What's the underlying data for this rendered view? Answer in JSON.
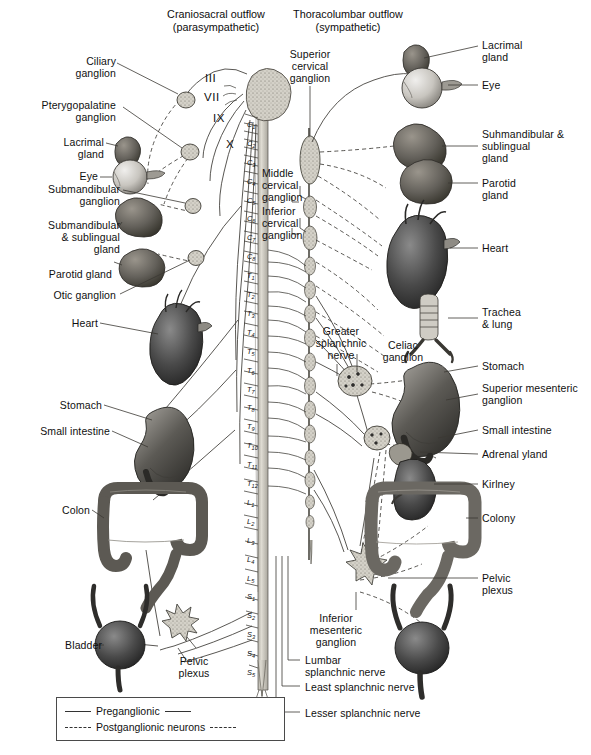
{
  "figure": {
    "width": 591,
    "height": 755
  },
  "headers": {
    "left": "Craniosacral outflow\n(parasympathetic)",
    "right": "Thoracolumbar outflow\n(sympathetic)"
  },
  "cranial_nerves": [
    {
      "numeral": "III"
    },
    {
      "numeral": "VII"
    },
    {
      "numeral": "IX"
    },
    {
      "numeral": "X"
    }
  ],
  "spinal_segments": [
    "C1",
    "C2",
    "C3",
    "C4",
    "C5",
    "C6",
    "C7",
    "C8",
    "T1",
    "T2",
    "T3",
    "T4",
    "T5",
    "T6",
    "T7",
    "T8",
    "T9",
    "T10",
    "T11",
    "T12",
    "L1",
    "L2",
    "L3",
    "L4",
    "L5",
    "S1",
    "S2",
    "S3",
    "S4",
    "S5"
  ],
  "left_labels": [
    {
      "text": "Ciliary\nganglion",
      "name": "label-ciliary-ganglion"
    },
    {
      "text": "Pterygopalatine\nganglion",
      "name": "label-pterygopalatine-ganglion"
    },
    {
      "text": "Lacrimal\ngland",
      "name": "label-lacrimal-gland"
    },
    {
      "text": "Eye",
      "name": "label-eye"
    },
    {
      "text": "Submandibular\nganglion",
      "name": "label-submandibular-ganglion"
    },
    {
      "text": "Submandibular\n& sublingual\ngland",
      "name": "label-submandibular-sublingual-gland"
    },
    {
      "text": "Parotid gland",
      "name": "label-parotid-gland"
    },
    {
      "text": "Otic ganglion",
      "name": "label-otic-ganglion"
    },
    {
      "text": "Heart",
      "name": "label-heart"
    },
    {
      "text": "Stomach",
      "name": "label-stomach"
    },
    {
      "text": "Small intestine",
      "name": "label-small-intestine"
    },
    {
      "text": "Colon",
      "name": "label-colon"
    },
    {
      "text": "Bladder",
      "name": "label-bladder"
    }
  ],
  "right_labels": [
    {
      "text": "Lacrimal\ngland",
      "name": "label-lacrimal-gland-sym"
    },
    {
      "text": "Eye",
      "name": "label-eye-sym"
    },
    {
      "text": "Suhmandibular &\nsublingual\ngland",
      "name": "label-submandibular-sublingual-gland-sym"
    },
    {
      "text": "Parotid\ngland",
      "name": "label-parotid-gland-sym"
    },
    {
      "text": "Heart",
      "name": "label-heart-sym"
    },
    {
      "text": "Trachea\n& lung",
      "name": "label-trachea-lung"
    },
    {
      "text": "Stomach",
      "name": "label-stomach-sym"
    },
    {
      "text": "Superior mesenteric\nganglion",
      "name": "label-superior-mesenteric-ganglion"
    },
    {
      "text": "Small intestine",
      "name": "label-small-intestine-sym"
    },
    {
      "text": "Adrenal yland",
      "name": "label-adrenal-gland"
    },
    {
      "text": "Kirlney",
      "name": "label-kidney"
    },
    {
      "text": "Colony",
      "name": "label-colon-sym"
    },
    {
      "text": "Pelvic\nplexus",
      "name": "label-pelvic-plexus-sym"
    }
  ],
  "inner_labels": {
    "superior_cervical_ganglion": "Superior\ncervical\nganglion",
    "middle_cervical_ganglion": "Middle\ncervical\nganglion",
    "inferior_cervical_ganglion": "Inferior\ncervical\nganglion",
    "greater_splanchnic_nerve": "Greater\nsplanchnic\nnerve",
    "celiac_ganglion": "Celiac\nganglion",
    "inferior_mesenteric_ganglion": "Inferior\nmesenteric\nganglion",
    "pelvic_plexus_left": "Pelvic\nplexus",
    "lumbar_splanchnic_nerve": "Lumbar\nsplanchnic nerve",
    "least_splanchnic_nerve": "Least splanchnic nerve",
    "lesser_splanchnic_nerve": "Lesser splanchnic nerve"
  },
  "legend": {
    "preganglionic": "Preganglionic",
    "postganglionic": "Postganglionic neurons"
  },
  "colors": {
    "ink": "#111111",
    "line": "#333333",
    "organ_dark": "#3a3a3a",
    "organ_mid": "#6e6e6e",
    "organ_light": "#b8b8b8",
    "ganglion_fill": "#c9c6bd",
    "cord_fill": "#cfccc4",
    "background": "#ffffff"
  }
}
